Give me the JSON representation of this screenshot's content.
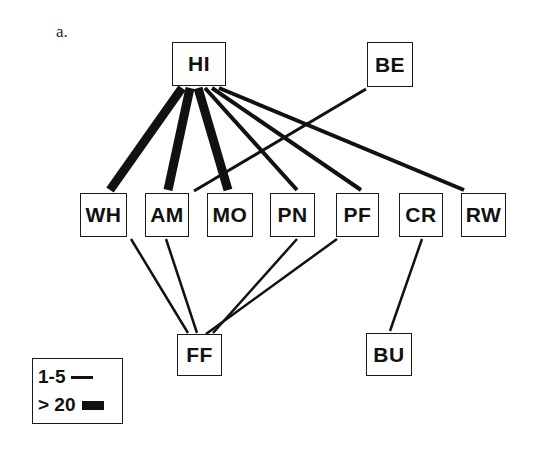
{
  "panel": {
    "label": "a."
  },
  "legend": {
    "name": "edge-weight-legend",
    "rows": [
      {
        "label": "1-5",
        "style": "thin"
      },
      {
        "label": "> 20",
        "style": "thick"
      }
    ]
  },
  "graph": {
    "type": "network-diagram",
    "nodes": [
      {
        "id": "HI",
        "label": "HI",
        "x": 172,
        "y": 42,
        "w": 54,
        "h": 44
      },
      {
        "id": "BE",
        "label": "BE",
        "x": 367,
        "y": 42,
        "w": 46,
        "h": 45
      },
      {
        "id": "WH",
        "label": "WH",
        "x": 80,
        "y": 193,
        "w": 47,
        "h": 44
      },
      {
        "id": "AM",
        "label": "AM",
        "x": 145,
        "y": 193,
        "w": 44,
        "h": 44
      },
      {
        "id": "MO",
        "label": "MO",
        "x": 207,
        "y": 193,
        "w": 46,
        "h": 44
      },
      {
        "id": "PN",
        "label": "PN",
        "x": 270,
        "y": 193,
        "w": 45,
        "h": 44
      },
      {
        "id": "PF",
        "label": "PF",
        "x": 336,
        "y": 193,
        "w": 43,
        "h": 44
      },
      {
        "id": "CR",
        "label": "CR",
        "x": 399,
        "y": 193,
        "w": 44,
        "h": 44
      },
      {
        "id": "RW",
        "label": "RW",
        "x": 461,
        "y": 193,
        "w": 45,
        "h": 44
      },
      {
        "id": "FF",
        "label": "FF",
        "x": 177,
        "y": 334,
        "w": 45,
        "h": 42
      },
      {
        "id": "BU",
        "label": "BU",
        "x": 366,
        "y": 333,
        "w": 46,
        "h": 43
      }
    ],
    "edges": [
      {
        "source": "HI",
        "target": "WH",
        "weight_class": "> 20",
        "width": 9,
        "x1": 182,
        "y1": 88,
        "x2": 110,
        "y2": 190
      },
      {
        "source": "HI",
        "target": "AM",
        "weight_class": "> 20",
        "width": 9,
        "x1": 190,
        "y1": 88,
        "x2": 168,
        "y2": 190
      },
      {
        "source": "HI",
        "target": "MO",
        "weight_class": "> 20",
        "width": 9,
        "x1": 198,
        "y1": 88,
        "x2": 228,
        "y2": 190
      },
      {
        "source": "HI",
        "target": "PN",
        "weight_class": "1-5",
        "width": 4,
        "x1": 205,
        "y1": 88,
        "x2": 297,
        "y2": 190
      },
      {
        "source": "HI",
        "target": "PF",
        "weight_class": "1-5",
        "width": 4,
        "x1": 212,
        "y1": 88,
        "x2": 361,
        "y2": 190
      },
      {
        "source": "HI",
        "target": "RW",
        "weight_class": "1-5",
        "width": 4,
        "x1": 219,
        "y1": 88,
        "x2": 464,
        "y2": 190
      },
      {
        "source": "BE",
        "target": "MO",
        "weight_class": "1-5",
        "width": 3,
        "x1": 366,
        "y1": 89,
        "x2": 194,
        "y2": 191
      },
      {
        "source": "WH",
        "target": "FF",
        "weight_class": "1-5",
        "width": 2.5,
        "x1": 131,
        "y1": 239,
        "x2": 188,
        "y2": 333
      },
      {
        "source": "AM",
        "target": "FF",
        "weight_class": "1-5",
        "width": 2.5,
        "x1": 166,
        "y1": 239,
        "x2": 197,
        "y2": 333
      },
      {
        "source": "PN",
        "target": "FF",
        "weight_class": "1-5",
        "width": 2.5,
        "x1": 297,
        "y1": 239,
        "x2": 213,
        "y2": 333
      },
      {
        "source": "PF",
        "target": "FF",
        "weight_class": "1-5",
        "width": 2.5,
        "x1": 337,
        "y1": 239,
        "x2": 206,
        "y2": 334
      },
      {
        "source": "CR",
        "target": "BU",
        "weight_class": "1-5",
        "width": 2.5,
        "x1": 422,
        "y1": 239,
        "x2": 390,
        "y2": 331
      }
    ]
  }
}
